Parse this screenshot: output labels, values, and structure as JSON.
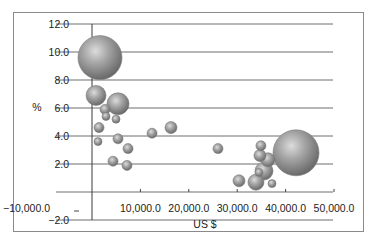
{
  "chart_data": {
    "type": "bubble",
    "title": "",
    "xlabel": "US $",
    "ylabel": "%",
    "xlim": [
      -10000,
      50000
    ],
    "ylim": [
      -2,
      12
    ],
    "x_ticks": [
      {
        "value": -10000,
        "label": "−10,000.0"
      },
      {
        "value": 10000,
        "label": "10,000.0"
      },
      {
        "value": 20000,
        "label": "20,000.0"
      },
      {
        "value": 30000,
        "label": "30,000.0"
      },
      {
        "value": 40000,
        "label": "40,000.0"
      },
      {
        "value": 50000,
        "label": "50,000.0"
      }
    ],
    "y_ticks": [
      {
        "value": 12,
        "label": "12.0"
      },
      {
        "value": 10,
        "label": "10.0"
      },
      {
        "value": 8,
        "label": "8.0"
      },
      {
        "value": 6,
        "label": "6.0"
      },
      {
        "value": 4,
        "label": "4.0"
      },
      {
        "value": 2,
        "label": "2.0"
      },
      {
        "value": -2,
        "label": "−2.0"
      }
    ],
    "grid": "horizontal",
    "legend": "none",
    "bubble_color": "#8c8c8c",
    "points": [
      {
        "x": 1650,
        "y": 9.6,
        "size": 22
      },
      {
        "x": 830,
        "y": 6.9,
        "size": 10
      },
      {
        "x": 5370,
        "y": 6.3,
        "size": 11
      },
      {
        "x": 2690,
        "y": 5.9,
        "size": 5
      },
      {
        "x": 2890,
        "y": 5.4,
        "size": 4
      },
      {
        "x": 4960,
        "y": 5.2,
        "size": 4
      },
      {
        "x": 1450,
        "y": 4.6,
        "size": 5
      },
      {
        "x": 1240,
        "y": 3.6,
        "size": 4
      },
      {
        "x": 5370,
        "y": 3.8,
        "size": 5
      },
      {
        "x": 7440,
        "y": 3.1,
        "size": 5
      },
      {
        "x": 4340,
        "y": 2.2,
        "size": 5
      },
      {
        "x": 7230,
        "y": 1.9,
        "size": 5
      },
      {
        "x": 12400,
        "y": 4.2,
        "size": 5
      },
      {
        "x": 16320,
        "y": 4.6,
        "size": 6
      },
      {
        "x": 26030,
        "y": 3.1,
        "size": 5
      },
      {
        "x": 34900,
        "y": 3.3,
        "size": 5
      },
      {
        "x": 34700,
        "y": 2.6,
        "size": 6
      },
      {
        "x": 36360,
        "y": 2.3,
        "size": 7
      },
      {
        "x": 35540,
        "y": 1.5,
        "size": 9
      },
      {
        "x": 34500,
        "y": 1.4,
        "size": 4
      },
      {
        "x": 30370,
        "y": 0.8,
        "size": 6
      },
      {
        "x": 33880,
        "y": 0.7,
        "size": 8
      },
      {
        "x": 37190,
        "y": 0.6,
        "size": 4
      },
      {
        "x": 42150,
        "y": 2.8,
        "size": 23
      }
    ]
  }
}
